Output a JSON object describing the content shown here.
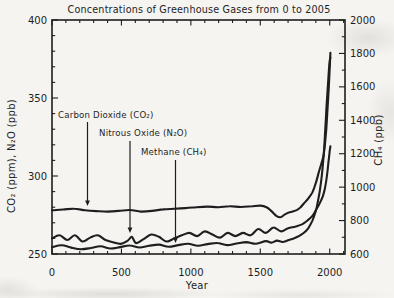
{
  "figure_caption": "scanned line chart of greenhouse gas concentrations",
  "ink_color": "#1e1e1e",
  "paper_color": "#f5f4f1",
  "chart_data": {
    "type": "line",
    "title": "Concentrations of Greenhouse Gases from 0 to 2005",
    "xlabel": "Year",
    "ylabel_left": "CO₂ (ppm), N₂O (ppb)",
    "ylabel_right": "CH₄ (ppb)",
    "grid": false,
    "legend_position": "none",
    "line_color": "#1e1e1e",
    "x_range": [
      0,
      2110
    ],
    "x_ticks": [
      0,
      500,
      1000,
      1500,
      2000
    ],
    "x_minor_step": 100,
    "y_left_range": [
      250,
      400
    ],
    "y_left_ticks": [
      250,
      300,
      350,
      400
    ],
    "y_left_minor_step": 10,
    "y_right_range": [
      600,
      2000
    ],
    "y_right_ticks": [
      600,
      800,
      1000,
      1200,
      1400,
      1600,
      1800,
      2000
    ],
    "y_right_minor_step": 100,
    "series": [
      {
        "id": "co2",
        "name": "Carbon Dioxide (CO₂)",
        "unit": "ppm",
        "axis": "left",
        "points": [
          [
            0,
            278
          ],
          [
            80,
            278.5
          ],
          [
            160,
            279
          ],
          [
            240,
            278
          ],
          [
            320,
            277.5
          ],
          [
            400,
            277.2
          ],
          [
            480,
            277.6
          ],
          [
            560,
            278.2
          ],
          [
            640,
            277.2
          ],
          [
            720,
            277.6
          ],
          [
            800,
            278.6
          ],
          [
            880,
            279
          ],
          [
            960,
            279.4
          ],
          [
            1040,
            280
          ],
          [
            1120,
            280.4
          ],
          [
            1200,
            280
          ],
          [
            1280,
            280.6
          ],
          [
            1360,
            280.1
          ],
          [
            1440,
            280.6
          ],
          [
            1500,
            281
          ],
          [
            1545,
            280
          ],
          [
            1580,
            277.5
          ],
          [
            1615,
            274.5
          ],
          [
            1645,
            273.5
          ],
          [
            1675,
            275.2
          ],
          [
            1705,
            276.6
          ],
          [
            1735,
            277.3
          ],
          [
            1765,
            278.3
          ],
          [
            1790,
            280
          ],
          [
            1815,
            282.5
          ],
          [
            1845,
            285.5
          ],
          [
            1875,
            289.5
          ],
          [
            1900,
            295.5
          ],
          [
            1920,
            302
          ],
          [
            1940,
            308
          ],
          [
            1955,
            313
          ],
          [
            1965,
            320
          ],
          [
            1975,
            330
          ],
          [
            1985,
            344
          ],
          [
            1993,
            357
          ],
          [
            2000,
            369
          ],
          [
            2005,
            379
          ]
        ]
      },
      {
        "id": "n2o",
        "name": "Nitrous Oxide (N₂O)",
        "unit": "ppb",
        "axis": "left",
        "points": [
          [
            0,
            260
          ],
          [
            55,
            262
          ],
          [
            110,
            259
          ],
          [
            165,
            262
          ],
          [
            220,
            258
          ],
          [
            275,
            260.5
          ],
          [
            330,
            262
          ],
          [
            385,
            259
          ],
          [
            440,
            257.5
          ],
          [
            495,
            256.5
          ],
          [
            545,
            258.5
          ],
          [
            575,
            261
          ],
          [
            605,
            257
          ],
          [
            660,
            259.5
          ],
          [
            715,
            262.5
          ],
          [
            770,
            261
          ],
          [
            825,
            258
          ],
          [
            880,
            260
          ],
          [
            935,
            262
          ],
          [
            990,
            263.5
          ],
          [
            1045,
            261.5
          ],
          [
            1100,
            264.5
          ],
          [
            1155,
            262.5
          ],
          [
            1210,
            260.5
          ],
          [
            1265,
            263.5
          ],
          [
            1320,
            261.5
          ],
          [
            1375,
            263.5
          ],
          [
            1430,
            262
          ],
          [
            1485,
            266
          ],
          [
            1540,
            263.5
          ],
          [
            1595,
            267
          ],
          [
            1650,
            264.5
          ],
          [
            1700,
            266.5
          ],
          [
            1750,
            267.5
          ],
          [
            1800,
            269
          ],
          [
            1840,
            271.5
          ],
          [
            1875,
            274.5
          ],
          [
            1900,
            278
          ],
          [
            1925,
            282
          ],
          [
            1950,
            287
          ],
          [
            1965,
            292
          ],
          [
            1980,
            300
          ],
          [
            1990,
            308
          ],
          [
            2000,
            316
          ],
          [
            2005,
            319
          ]
        ]
      },
      {
        "id": "ch4",
        "name": "Methane (CH₄)",
        "unit": "ppb",
        "axis": "right",
        "points": [
          [
            0,
            641
          ],
          [
            70,
            652
          ],
          [
            140,
            638
          ],
          [
            210,
            629
          ],
          [
            280,
            636
          ],
          [
            350,
            646
          ],
          [
            420,
            633
          ],
          [
            490,
            641
          ],
          [
            560,
            651
          ],
          [
            630,
            639
          ],
          [
            700,
            649
          ],
          [
            770,
            656
          ],
          [
            840,
            643
          ],
          [
            910,
            653
          ],
          [
            980,
            661
          ],
          [
            1050,
            649
          ],
          [
            1120,
            659
          ],
          [
            1190,
            666
          ],
          [
            1260,
            653
          ],
          [
            1330,
            663
          ],
          [
            1400,
            671
          ],
          [
            1470,
            661
          ],
          [
            1540,
            677
          ],
          [
            1580,
            668
          ],
          [
            1620,
            680
          ],
          [
            1660,
            672
          ],
          [
            1700,
            682
          ],
          [
            1740,
            693
          ],
          [
            1775,
            706
          ],
          [
            1810,
            724
          ],
          [
            1845,
            754
          ],
          [
            1875,
            800
          ],
          [
            1900,
            858
          ],
          [
            1915,
            915
          ],
          [
            1930,
            985
          ],
          [
            1945,
            1085
          ],
          [
            1957,
            1200
          ],
          [
            1967,
            1330
          ],
          [
            1977,
            1480
          ],
          [
            1987,
            1610
          ],
          [
            1994,
            1700
          ],
          [
            2000,
            1756
          ],
          [
            2005,
            1774
          ]
        ]
      }
    ],
    "annotations": [
      {
        "id": "co2",
        "label": "Carbon Dioxide (CO₂)",
        "text_x": 58,
        "text_y": 118,
        "arrow_x": 87.5,
        "arrow_top": 122,
        "arrow_tip": 206
      },
      {
        "id": "n2o",
        "label": "Nitrous Oxide (N₂O)",
        "text_x": 99,
        "text_y": 136,
        "arrow_x": 130,
        "arrow_top": 141,
        "arrow_tip": 233
      },
      {
        "id": "ch4",
        "label": "Methane (CH₄)",
        "text_x": 141,
        "text_y": 155,
        "arrow_x": 175.5,
        "arrow_top": 160,
        "arrow_tip": 243
      }
    ]
  }
}
